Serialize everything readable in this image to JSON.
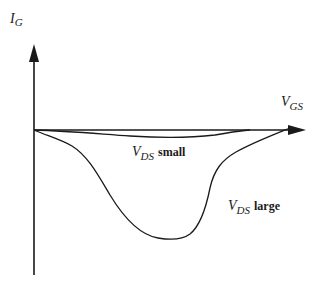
{
  "diagram": {
    "type": "qualitative-curve-sketch",
    "y_axis": {
      "symbol": "I",
      "subscript": "G"
    },
    "x_axis": {
      "symbol": "V",
      "subscript": "GS"
    },
    "curves": [
      {
        "id": "small",
        "symbol": "V",
        "subscript": "DS",
        "qualifier": "small"
      },
      {
        "id": "large",
        "symbol": "V",
        "subscript": "DS",
        "qualifier": "large"
      }
    ],
    "colors": {
      "line": "#1a1a1a",
      "background": "#ffffff"
    }
  }
}
